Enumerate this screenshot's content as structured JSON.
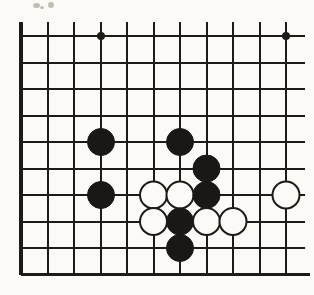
{
  "figure": {
    "board_kind": "go-board-partial",
    "background_color": "#fbfaf6",
    "line_color": "#1d1b17",
    "black_stone_color": "#1a1714",
    "white_stone_color": "#fbfaf6",
    "white_stone_border_color": "#1d1b17"
  },
  "grid": {
    "origin_x": 21,
    "origin_y": 36,
    "spacing": 26.5,
    "columns": 11,
    "rows": 10,
    "line_width_normal": 2.0,
    "line_width_edge": 3.2,
    "edges_drawn": [
      "bottom"
    ],
    "column_x": [
      21,
      47.5,
      74,
      100.5,
      127,
      153.5,
      180,
      206.5,
      233,
      259.5,
      286
    ],
    "row_y": [
      36,
      62.5,
      89,
      115.5,
      142,
      168.5,
      195,
      221.5,
      248,
      274.5
    ]
  },
  "star_points": [
    {
      "name": "hoshi-left",
      "col": 3,
      "row": 0,
      "x": 101,
      "y": 36,
      "radius": 4.0
    },
    {
      "name": "hoshi-right",
      "col": 10,
      "row": 0,
      "x": 286,
      "y": 36,
      "radius": 4.0
    }
  ],
  "stones": [
    {
      "id": "stone-1",
      "color": "black",
      "col": 3,
      "row": 4,
      "x": 101,
      "y": 142,
      "radius": 13.5
    },
    {
      "id": "stone-2",
      "color": "black",
      "col": 6,
      "row": 4,
      "x": 180,
      "y": 142,
      "radius": 13.5
    },
    {
      "id": "stone-3",
      "color": "black",
      "col": 7,
      "row": 5,
      "x": 206.5,
      "y": 168.5,
      "radius": 13.5
    },
    {
      "id": "stone-4",
      "color": "black",
      "col": 3,
      "row": 6,
      "x": 101,
      "y": 195,
      "radius": 13.5
    },
    {
      "id": "stone-5",
      "color": "white",
      "col": 5,
      "row": 6,
      "x": 153.5,
      "y": 195,
      "radius": 13.5
    },
    {
      "id": "stone-6",
      "color": "white",
      "col": 6,
      "row": 6,
      "x": 180,
      "y": 195,
      "radius": 13.5
    },
    {
      "id": "stone-7",
      "color": "black",
      "col": 7,
      "row": 6,
      "x": 206.5,
      "y": 195,
      "radius": 13.5
    },
    {
      "id": "stone-8",
      "color": "white",
      "col": 10,
      "row": 6,
      "x": 286,
      "y": 195,
      "radius": 13.5
    },
    {
      "id": "stone-9",
      "color": "white",
      "col": 5,
      "row": 7,
      "x": 153.5,
      "y": 221.5,
      "radius": 13.5
    },
    {
      "id": "stone-10",
      "color": "black",
      "col": 6,
      "row": 7,
      "x": 180,
      "y": 221.5,
      "radius": 13.5
    },
    {
      "id": "stone-11",
      "color": "white",
      "col": 7,
      "row": 7,
      "x": 206.5,
      "y": 221.5,
      "radius": 13.5
    },
    {
      "id": "stone-12",
      "color": "white",
      "col": 8,
      "row": 7,
      "x": 233,
      "y": 221.5,
      "radius": 13.5
    },
    {
      "id": "stone-13",
      "color": "black",
      "col": 6,
      "row": 8,
      "x": 180,
      "y": 248,
      "radius": 13.5
    }
  ],
  "stone_counts": {
    "black": 7,
    "white": 6,
    "total": 13
  },
  "artifacts": [
    {
      "name": "scan-smudge-top-left-a",
      "x": 33,
      "y": 3,
      "w": 7,
      "h": 5
    },
    {
      "name": "scan-smudge-top-left-b",
      "x": 48,
      "y": 2,
      "w": 6,
      "h": 6
    },
    {
      "name": "scan-smudge-top-left-c",
      "x": 40,
      "y": 6,
      "w": 4,
      "h": 3
    }
  ]
}
